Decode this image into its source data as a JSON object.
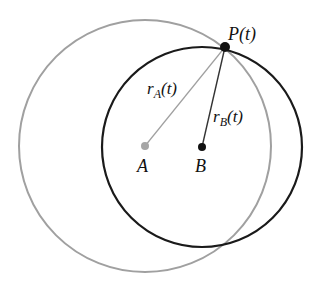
{
  "diagram": {
    "colors": {
      "circle_a": "#a0a0a0",
      "circle_b": "#1a1a1a",
      "radius_a_line": "#a0a0a0",
      "radius_b_line": "#333333",
      "point_a": "#a6a6a6",
      "point_b": "#111111",
      "point_p": "#111111"
    },
    "labels": {
      "p": "P(t)",
      "ra_main": "r",
      "ra_sub": "A",
      "ra_arg": "(t)",
      "rb_main": "r",
      "rb_sub": "B",
      "rb_arg": "(t)",
      "a": "A",
      "b": "B"
    },
    "geometry": {
      "A": [
        145,
        146
      ],
      "B": [
        202,
        147
      ],
      "P": [
        225,
        47
      ],
      "radius_A": 126,
      "radius_B": 100
    }
  }
}
